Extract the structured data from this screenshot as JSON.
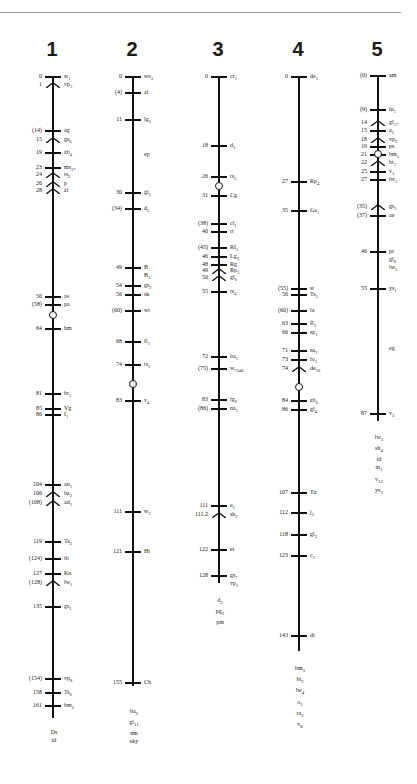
{
  "chart_data": {
    "type": "linkage_map",
    "title": "",
    "chromosomes": [
      {
        "name": "1",
        "loci": [
          {
            "pos": "0",
            "gene": "sr1"
          },
          {
            "pos": "1",
            "gene": "vp5"
          },
          {
            "pos": "(14)",
            "gene": "ag"
          },
          {
            "pos": "15",
            "gene": "gs6"
          },
          {
            "pos": "19",
            "gene": "zb4"
          },
          {
            "pos": "23",
            "gene": "ms17"
          },
          {
            "pos": "24",
            "gene": "ts2"
          },
          {
            "pos": "26",
            "gene": "p"
          },
          {
            "pos": "28",
            "gene": "zl"
          },
          {
            "pos": "56",
            "gene": "as"
          },
          {
            "pos": "(58)",
            "gene": "pa"
          },
          {
            "pos": "64",
            "gene": "hm"
          },
          {
            "pos": "81",
            "gene": "br1"
          },
          {
            "pos": "85",
            "gene": "Vg"
          },
          {
            "pos": "86",
            "gene": "f1"
          },
          {
            "pos": "104",
            "gene": "an1"
          },
          {
            "pos": "106",
            "gene": "bz2"
          },
          {
            "pos": "(108)",
            "gene": "ad1"
          },
          {
            "pos": "119",
            "gene": "Ts3"
          },
          {
            "pos": "(124)",
            "gene": "tb"
          },
          {
            "pos": "127",
            "gene": "Kn"
          },
          {
            "pos": "(128)",
            "gene": "lw1"
          },
          {
            "pos": "135",
            "gene": "gs1"
          },
          {
            "pos": "(154)",
            "gene": "vp8"
          },
          {
            "pos": "158",
            "gene": "Ts6"
          },
          {
            "pos": "161",
            "gene": "bm2"
          }
        ],
        "unplaced": [
          "Ds",
          "id"
        ]
      },
      {
        "name": "2",
        "loci": [
          {
            "pos": "0",
            "gene": "ws3"
          },
          {
            "pos": "(4)",
            "gene": "al"
          },
          {
            "pos": "11",
            "gene": "lg1"
          },
          {
            "pos": "",
            "gene": "ep"
          },
          {
            "pos": "30",
            "gene": "gl2"
          },
          {
            "pos": "(34)",
            "gene": "d5"
          },
          {
            "pos": "49",
            "gene": "B / B2"
          },
          {
            "pos": "54",
            "gene": "gs2"
          },
          {
            "pos": "56",
            "gene": "sk"
          },
          {
            "pos": "(60)",
            "gene": "wt"
          },
          {
            "pos": "68",
            "gene": "fl1"
          },
          {
            "pos": "74",
            "gene": "ts1"
          },
          {
            "pos": "83",
            "gene": "v4"
          },
          {
            "pos": "111",
            "gene": "w3"
          },
          {
            "pos": "121",
            "gene": "Ht"
          },
          {
            "pos": "155",
            "gene": "Ch"
          }
        ],
        "unplaced": [
          "ba2",
          "gl11",
          "mn",
          "sky"
        ]
      },
      {
        "name": "3",
        "loci": [
          {
            "pos": "0",
            "gene": "cr1"
          },
          {
            "pos": "18",
            "gene": "d1"
          },
          {
            "pos": "26",
            "gene": "ts2"
          },
          {
            "pos": "31",
            "gene": "Cg"
          },
          {
            "pos": "(38)",
            "gene": "cl1"
          },
          {
            "pos": "40",
            "gene": "rt"
          },
          {
            "pos": "(45)",
            "gene": "Rf1"
          },
          {
            "pos": "46",
            "gene": "Lg3"
          },
          {
            "pos": "48",
            "gene": "Rg"
          },
          {
            "pos": "49",
            "gene": "Rp3"
          },
          {
            "pos": "50",
            "gene": "gl6"
          },
          {
            "pos": "55",
            "gene": "ts4"
          },
          {
            "pos": "72",
            "gene": "ba1"
          },
          {
            "pos": "(75)",
            "gene": "w7348"
          },
          {
            "pos": "83",
            "gene": "lg2"
          },
          {
            "pos": "(86)",
            "gene": "na1"
          },
          {
            "pos": "111",
            "gene": "a1"
          },
          {
            "pos": "111.2",
            "gene": "sh2"
          },
          {
            "pos": "122",
            "gene": "et"
          },
          {
            "pos": "128",
            "gene": "gs7 / vp1"
          }
        ],
        "unplaced": [
          "d2",
          "pg2",
          "pm"
        ]
      },
      {
        "name": "4",
        "loci": [
          {
            "pos": "0",
            "gene": "de1"
          },
          {
            "pos": "27",
            "gene": "Rp4"
          },
          {
            "pos": "35",
            "gene": "Ga1"
          },
          {
            "pos": "(55)",
            "gene": "st"
          },
          {
            "pos": "56",
            "gene": "Ts5"
          },
          {
            "pos": "(60)",
            "gene": "la"
          },
          {
            "pos": "63",
            "gene": "fl2"
          },
          {
            "pos": "66",
            "gene": "sp1"
          },
          {
            "pos": "71",
            "gene": "su1"
          },
          {
            "pos": "73",
            "gene": "lo1"
          },
          {
            "pos": "74",
            "gene": "de16"
          },
          {
            "pos": "84",
            "gene": "zb6"
          },
          {
            "pos": "86",
            "gene": "gl4"
          },
          {
            "pos": "107",
            "gene": "Tu"
          },
          {
            "pos": "112",
            "gene": "j2"
          },
          {
            "pos": "118",
            "gene": "gl3"
          },
          {
            "pos": "123",
            "gene": "c2"
          },
          {
            "pos": "143",
            "gene": "di"
          }
        ],
        "unplaced": [
          "bm3",
          "bt2",
          "lw4",
          "o1",
          "ra3",
          "v8"
        ]
      },
      {
        "name": "5",
        "loci": [
          {
            "pos": "(0)",
            "gene": "am"
          },
          {
            "pos": "(9)",
            "gene": "lu1"
          },
          {
            "pos": "14",
            "gene": "gl17"
          },
          {
            "pos": "15",
            "gene": "a2"
          },
          {
            "pos": "18",
            "gene": "vp2"
          },
          {
            "pos": "19",
            "gene": "ps"
          },
          {
            "pos": "21",
            "gene": "bm1"
          },
          {
            "pos": "22",
            "gene": "bt1"
          },
          {
            "pos": "25",
            "gene": "v3"
          },
          {
            "pos": "27",
            "gene": "bv1"
          },
          {
            "pos": "(35)",
            "gene": "gs2"
          },
          {
            "pos": "(37)",
            "gene": "ae"
          },
          {
            "pos": "46",
            "gene": "pr / gl8 / lw2"
          },
          {
            "pos": "55",
            "gene": "ys1"
          },
          {
            "pos": "",
            "gene": "eg"
          },
          {
            "pos": "87",
            "gene": "v2"
          }
        ],
        "unplaced": [
          "lw3",
          "sh4",
          "td",
          "tn1",
          "v12",
          "ys1"
        ]
      }
    ]
  },
  "layout": {
    "chrom_titles": [
      "1",
      "2",
      "3",
      "4",
      "5"
    ]
  }
}
